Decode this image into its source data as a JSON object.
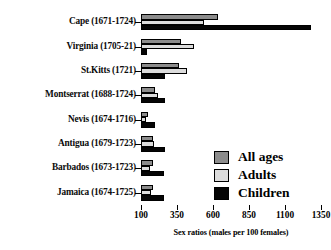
{
  "chart_data": {
    "type": "bar",
    "orientation": "horizontal",
    "title": "",
    "xlabel": "Sex ratios (males per 100 females)",
    "ylabel": "",
    "xlim": [
      100,
      1350
    ],
    "xticks": [
      100,
      350,
      600,
      850,
      1100,
      1350
    ],
    "xticklabels": [
      "100",
      "350",
      "600",
      "850",
      "1100",
      "1350"
    ],
    "grid": false,
    "legend_position": "center-right",
    "categories": [
      "Cape (1671-1724)",
      "Virginia (1705-21)",
      "St.Kitts (1721)",
      "Montserrat (1688-1724)",
      "Nevis (1674-1716)",
      "Antigua (1679-1723)",
      "Barbados (1673-1723)",
      "Jamaica (1674-1725)"
    ],
    "series": [
      {
        "name": "All ages",
        "color": "#8c8c8c",
        "values": [
          635,
          380,
          365,
          200,
          150,
          185,
          180,
          185
        ]
      },
      {
        "name": "Adults",
        "color": "#dcdcdc",
        "values": [
          535,
          465,
          420,
          215,
          135,
          190,
          165,
          170
        ]
      },
      {
        "name": "Children",
        "color": "#050505",
        "values": [
          1280,
          145,
          265,
          265,
          200,
          265,
          260,
          260
        ]
      }
    ]
  },
  "legend": {
    "items": [
      {
        "label": "All ages",
        "swatch": "allages"
      },
      {
        "label": "Adults",
        "swatch": "adults"
      },
      {
        "label": "Children",
        "swatch": "children"
      }
    ]
  }
}
